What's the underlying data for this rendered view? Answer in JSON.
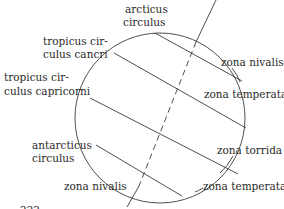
{
  "diagram": {
    "labels": {
      "arcticus_1": "arcticus",
      "arcticus_2": "circulus",
      "cancri_1": "tropicus cir-",
      "cancri_2": "culus cancri",
      "capricorni_1": "tropicus cir-",
      "capricorni_2": "culus capricorni",
      "antarcticus_1": "antarcticus",
      "antarcticus_2": "circulus",
      "zona_nivalis_north": "zona nivalis",
      "zona_temperata_north": "zona temperata",
      "zona_torrida": "zona torrida",
      "zona_temperata_south": "zona temperata",
      "zona_nivalis_south": "zona nivalis"
    },
    "page_fragment": "222",
    "colors": {
      "line": "#3a3a3a",
      "text": "#2a2a2a",
      "background": "#ffffff"
    }
  }
}
